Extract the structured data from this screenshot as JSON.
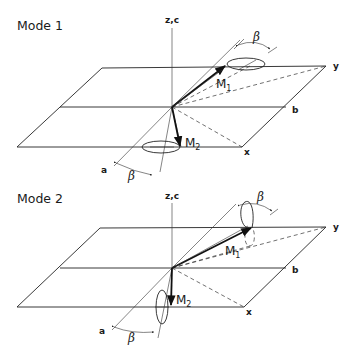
{
  "panels": [
    {
      "title": "Mode 1",
      "axis_vertical": "z,c",
      "axis_y": "y",
      "axis_x": "x",
      "axis_a": "a",
      "axis_b": "b",
      "moment_1": "M",
      "moment_1_sub": "1",
      "moment_2": "M",
      "moment_2_sub": "2",
      "angle_top": "β",
      "angle_bottom": "β",
      "precession_plane": "horizontal"
    },
    {
      "title": "Mode 2",
      "axis_vertical": "z,c",
      "axis_y": "y",
      "axis_x": "x",
      "axis_a": "a",
      "axis_b": "b",
      "moment_1": "M",
      "moment_1_sub": "1",
      "moment_2": "M",
      "moment_2_sub": "2",
      "angle_top": "β",
      "angle_bottom": "β",
      "precession_plane": "vertical"
    }
  ],
  "colors": {
    "ink": "#1a1a1a",
    "background": "#ffffff"
  }
}
